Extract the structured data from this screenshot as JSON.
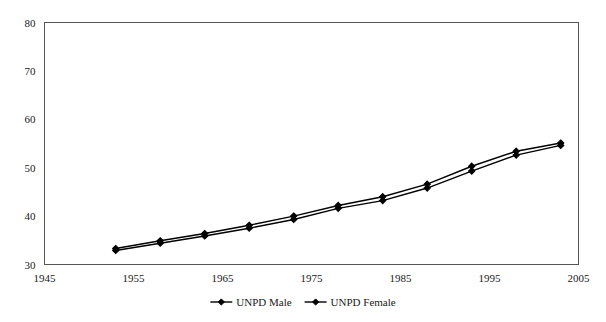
{
  "chart_data": {
    "type": "line",
    "title": "",
    "subtitle": "",
    "xlabel": "",
    "ylabel": "",
    "xlim": [
      1945,
      2005
    ],
    "ylim": [
      30,
      80
    ],
    "grid": true,
    "legend_position": "bottom",
    "x": [
      1953,
      1958,
      1963,
      1968,
      1973,
      1978,
      1983,
      1988,
      1993,
      1998,
      2003
    ],
    "xticks": [
      1945,
      1955,
      1965,
      1975,
      1985,
      1995,
      2005
    ],
    "xtick_labels": [
      "1945",
      "1955",
      "1965",
      "1975",
      "1985",
      "1995",
      "2005"
    ],
    "yticks": [
      30,
      40,
      50,
      60,
      70,
      80
    ],
    "ytick_labels": [
      "30",
      "40",
      "50",
      "60",
      "70",
      "80"
    ],
    "series": [
      {
        "name": "UNPD Male",
        "marker": "diamond",
        "color": "#000000",
        "values": [
          32.9,
          34.4,
          35.9,
          37.5,
          39.3,
          41.6,
          43.2,
          45.8,
          49.3,
          52.6,
          54.6
        ]
      },
      {
        "name": "UNPD Female",
        "marker": "diamond",
        "color": "#000000",
        "values": [
          33.3,
          34.9,
          36.4,
          38.1,
          40.0,
          42.2,
          44.0,
          46.6,
          50.3,
          53.4,
          55.1
        ]
      }
    ]
  },
  "legend": {
    "items": [
      {
        "label": "UNPD Male"
      },
      {
        "label": "UNPD Female"
      }
    ]
  },
  "axes": {
    "y_axis_name": "value-axis",
    "x_axis_name": "year-axis"
  }
}
